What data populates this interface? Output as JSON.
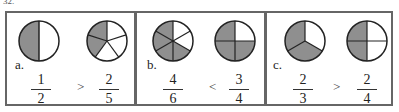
{
  "question_number": "32.",
  "problems": [
    {
      "label": "a.",
      "left": {
        "numerator": "1",
        "denominator": "2",
        "parts": 2,
        "shaded": 1
      },
      "operator": ">",
      "right": {
        "numerator": "2",
        "denominator": "5",
        "parts": 5,
        "shaded": 2
      }
    },
    {
      "label": "b.",
      "left": {
        "numerator": "4",
        "denominator": "6",
        "parts": 6,
        "shaded": 4
      },
      "operator": "<",
      "right": {
        "numerator": "3",
        "denominator": "4",
        "parts": 4,
        "shaded": 3
      }
    },
    {
      "label": "c.",
      "left": {
        "numerator": "2",
        "denominator": "3",
        "parts": 3,
        "shaded": 2
      },
      "operator": ">",
      "right": {
        "numerator": "2",
        "denominator": "4",
        "parts": 4,
        "shaded": 2
      }
    }
  ],
  "colors": {
    "shade": "#8f8f8f",
    "line": "#222222",
    "border": "#666666"
  }
}
